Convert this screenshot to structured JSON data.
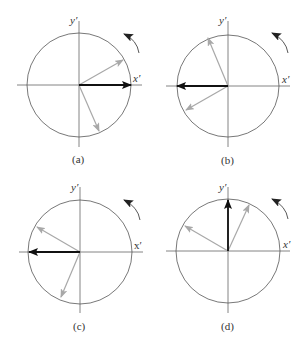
{
  "figure": {
    "colors": {
      "axis": "#555555",
      "circle": "#555555",
      "gray_vector": "#a8a8a8",
      "black_vector": "#111111",
      "rotation_arrow": "#444444"
    },
    "panels": [
      {
        "id": "a",
        "label": "(a)",
        "x_axis_label": "x′",
        "y_axis_label": "y′",
        "rotation": "counter-clockwise",
        "center": [
          79,
          85
        ],
        "radius": 52,
        "black_vector_tip": [
          131,
          85
        ],
        "gray_vector_tips": [
          [
            123,
            60
          ],
          [
            99,
            131
          ]
        ]
      },
      {
        "id": "b",
        "label": "(b)",
        "x_axis_label": "x′",
        "y_axis_label": "y′",
        "rotation": "counter-clockwise",
        "center": [
          228,
          86
        ],
        "radius": 51,
        "black_vector_tip": [
          177,
          86
        ],
        "gray_vector_tips": [
          [
            208,
            38
          ],
          [
            186,
            110
          ]
        ]
      },
      {
        "id": "c",
        "label": "(c)",
        "x_axis_label": "x′",
        "y_axis_label": "y′",
        "rotation": "counter-clockwise",
        "center": [
          80,
          252
        ],
        "radius": 52,
        "black_vector_tip": [
          29,
          252
        ],
        "gray_vector_tips": [
          [
            37,
            227
          ],
          [
            61,
            297
          ]
        ]
      },
      {
        "id": "d",
        "label": "(d)",
        "x_axis_label": "x′",
        "y_axis_label": "y′",
        "rotation": "counter-clockwise",
        "center": [
          228,
          251
        ],
        "radius": 52,
        "black_vector_tip": [
          228,
          200
        ],
        "gray_vector_tips": [
          [
            249,
            205
          ],
          [
            185,
            226
          ]
        ]
      }
    ]
  }
}
